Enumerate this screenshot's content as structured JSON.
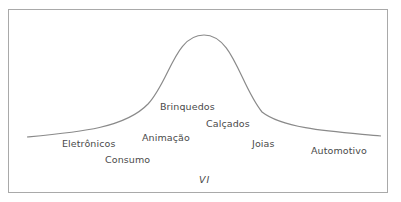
{
  "diagram": {
    "type": "bell-curve",
    "axis_label": "VI",
    "labels": [
      {
        "id": "eletronicos",
        "text": "Eletrônicos",
        "x": 62,
        "y": 138
      },
      {
        "id": "consumo",
        "text": "Consumo",
        "x": 105,
        "y": 154
      },
      {
        "id": "animacao",
        "text": "Animação",
        "x": 142,
        "y": 132
      },
      {
        "id": "brinquedos",
        "text": "Brinquedos",
        "x": 160,
        "y": 101
      },
      {
        "id": "calcados",
        "text": "Calçados",
        "x": 206,
        "y": 118
      },
      {
        "id": "joias",
        "text": "Joias",
        "x": 252,
        "y": 138
      },
      {
        "id": "automotivo",
        "text": "Automotivo",
        "x": 311,
        "y": 145
      }
    ],
    "colors": {
      "curve": "#8a8a8a",
      "frame": "#a9a9a9",
      "text": "#4a4a4a"
    }
  }
}
